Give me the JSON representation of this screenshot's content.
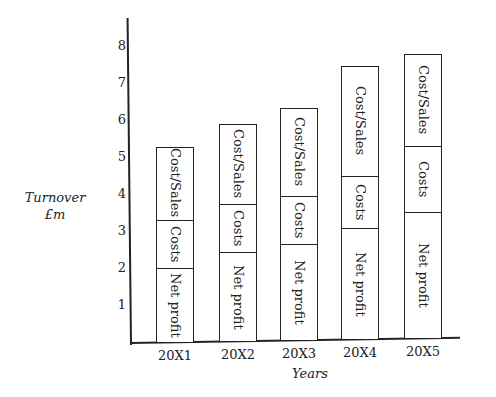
{
  "chart_data": {
    "type": "bar",
    "stacked": true,
    "title": "",
    "xlabel": "Years",
    "ylabel": "Turnover £m",
    "ylabel_lines": [
      "Turnover",
      "£m"
    ],
    "yticks": [
      "1",
      "2",
      "3",
      "4",
      "5",
      "6",
      "7",
      "8"
    ],
    "ylim": [
      0,
      8
    ],
    "categories": [
      "20X1",
      "20X2",
      "20X3",
      "20X4",
      "20X5"
    ],
    "series": [
      {
        "name": "Net profit",
        "values": [
          2.0,
          2.4,
          2.6,
          3.0,
          3.4
        ]
      },
      {
        "name": "Costs",
        "values": [
          1.3,
          1.3,
          1.3,
          1.4,
          1.8
        ]
      },
      {
        "name": "Cost/Sales",
        "values": [
          2.0,
          2.2,
          2.4,
          3.0,
          2.5
        ]
      }
    ],
    "totals": [
      5.3,
      5.9,
      6.3,
      7.4,
      7.7
    ],
    "segment_labels": [
      "Net profit",
      "Costs",
      "Cost/Sales"
    ],
    "grid": false,
    "legend": "none (labels inside bar segments)"
  }
}
